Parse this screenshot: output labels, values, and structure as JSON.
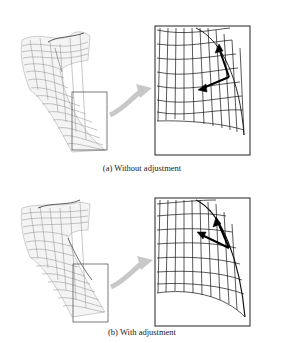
{
  "figure": {
    "panels": [
      {
        "id": "a",
        "caption": "(a) Without adjustment",
        "left_view": "mesh-surface-overview",
        "right_view": "zoomed-mesh-detail",
        "arrow": "gray-curved-arrow",
        "vectors": "two-black-arrows-not-aligned"
      },
      {
        "id": "b",
        "caption": "(b) With adjustment",
        "left_view": "mesh-surface-overview",
        "right_view": "zoomed-mesh-detail",
        "arrow": "gray-curved-arrow",
        "vectors": "two-black-arrows-aligned-to-boundary"
      }
    ],
    "colors": {
      "mesh_light": "#9a9a9a",
      "mesh_dark": "#111111",
      "box_border": "#333333",
      "connector_arrow": "#c8c8c8",
      "vector_arrow": "#000000"
    }
  }
}
